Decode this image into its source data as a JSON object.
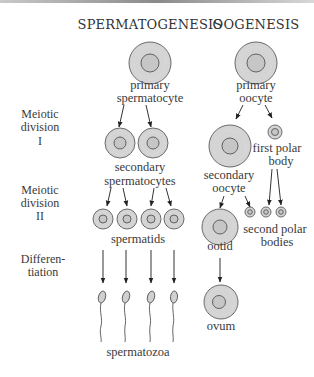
{
  "headers": {
    "left": "SPERMATOGENESIS",
    "right": "OOGENESIS"
  },
  "stages": {
    "meiosis1": [
      "Meiotic",
      "division",
      "I"
    ],
    "meiosis2": [
      "Meiotic",
      "division",
      "II"
    ],
    "differentiation": [
      "Differen-",
      "tiation"
    ]
  },
  "spermatogenesis": {
    "primary": [
      "primary",
      "spermatocyte"
    ],
    "secondary": [
      "secondary",
      "spermatocytes"
    ],
    "spermatids": "spermatids",
    "spermatozoa": "spermatozoa"
  },
  "oogenesis": {
    "primary": [
      "primary",
      "oocyte"
    ],
    "secondary": [
      "secondary",
      "oocyte"
    ],
    "first_polar": [
      "first polar",
      "body"
    ],
    "second_polar": [
      "second polar",
      "bodies"
    ],
    "ootid": "ootid",
    "ovum": "ovum"
  },
  "colors": {
    "cell_fill": "#d4d4d4",
    "outline": "#555555",
    "text": "#3a3a3a"
  }
}
